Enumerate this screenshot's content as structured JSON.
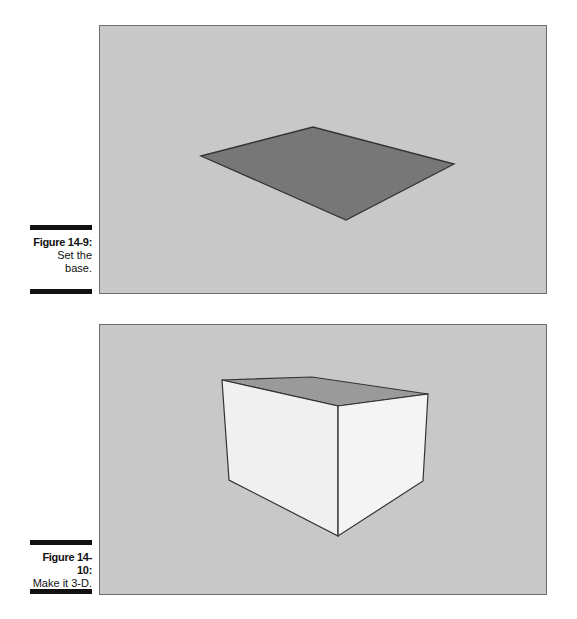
{
  "figures": [
    {
      "label": "Figure 14-9:",
      "caption": "Set the base.",
      "caption_lines": [
        "Set the",
        "base."
      ],
      "shape": "flat-rectangle"
    },
    {
      "label": "Figure 14-10:",
      "caption": "Make it 3-D.",
      "caption_lines": [
        "Make it 3-D."
      ],
      "shape": "box"
    }
  ],
  "colors": {
    "background": "#c8c8c8",
    "base_face": "#777777",
    "top_face": "#9a9a9a",
    "side_face": "#f0f0f0",
    "edge": "#333333"
  }
}
